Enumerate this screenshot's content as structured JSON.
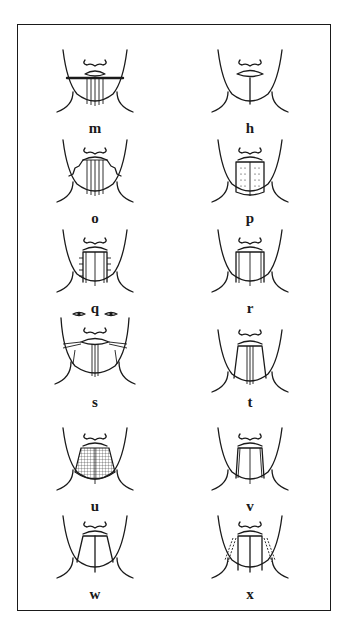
{
  "figure": {
    "panels": [
      {
        "label": "m",
        "pattern": "horizontal-band-with-vertical-stripes"
      },
      {
        "label": "h",
        "pattern": "single-vertical-line"
      },
      {
        "label": "o",
        "pattern": "zigzag-sides-vertical-stripes"
      },
      {
        "label": "p",
        "pattern": "dotted-block"
      },
      {
        "label": "q",
        "pattern": "block-with-side-ticks"
      },
      {
        "label": "r",
        "pattern": "block-with-vertical-stripes"
      },
      {
        "label": "s",
        "pattern": "full-face-cheek-bands"
      },
      {
        "label": "t",
        "pattern": "trapezoid-with-center-stripes"
      },
      {
        "label": "u",
        "pattern": "grid-hatched-block"
      },
      {
        "label": "v",
        "pattern": "trapezoid-with-center-line"
      },
      {
        "label": "w",
        "pattern": "outline-trapezoid-center-line"
      },
      {
        "label": "x",
        "pattern": "trapezoid-dashed-side-bands"
      }
    ]
  }
}
